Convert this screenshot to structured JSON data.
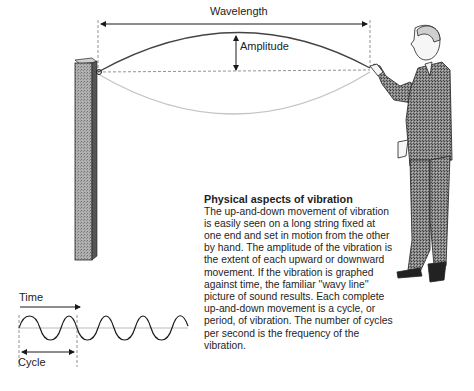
{
  "diagram": {
    "labels": {
      "wavelength": "Wavelength",
      "amplitude": "Amplitude",
      "time": "Time",
      "cycle": "Cycle"
    },
    "caption": {
      "title": "Physical aspects of vibration",
      "body": "The up-and-down movement of vibration is easily seen on a long string fixed at one end and set in motion from the other by hand. The amplitude of the vibration is the extent of each upward or downward movement. If the vibration is graphed against time, the familiar ''wavy line'' picture of sound results. Each complete up-and-down movement is a cycle, or period, of vibration. The number of cycles per second is the frequency of the vibration."
    },
    "elements": [
      "wooden-post",
      "vibrating-string",
      "man-holding-string",
      "sine-wave-graph"
    ],
    "colors": {
      "line": "#1a1a1a",
      "dashed": "#777777",
      "string-lower": "#bbbbbb",
      "post": "#9a9a9a",
      "suit": "#6e6e6e"
    }
  }
}
